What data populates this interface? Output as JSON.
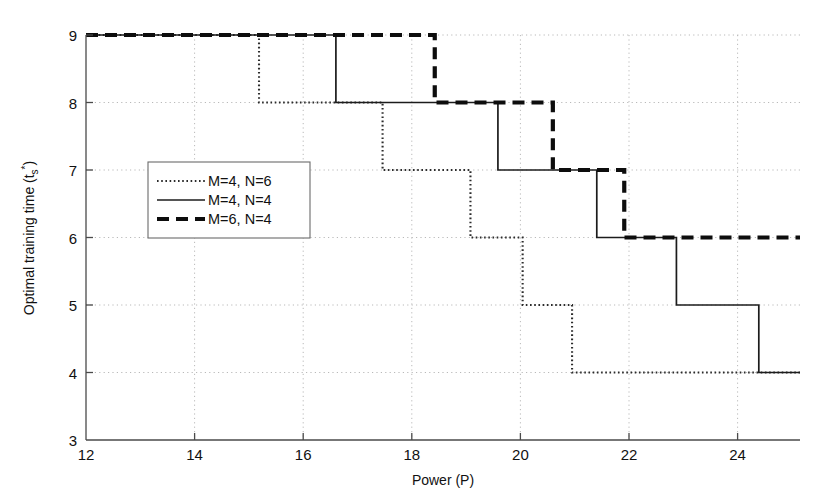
{
  "chart_data": {
    "type": "line",
    "title": "",
    "subtitle": "",
    "xlabel": "Power (P)",
    "ylabel": "Optimal training time (t",
    "ylabel_sub": "s",
    "ylabel_sup": "*",
    "ylabel_close": ")",
    "xlim": [
      12,
      25
    ],
    "ylim": [
      3,
      9
    ],
    "xticks": [
      12,
      14,
      16,
      18,
      20,
      22,
      24
    ],
    "xtick_labels": [
      "12",
      "14",
      "16",
      "18",
      "20",
      "22",
      "24"
    ],
    "yticks": [
      3,
      4,
      5,
      6,
      7,
      8,
      9
    ],
    "ytick_labels": [
      "3",
      "4",
      "5",
      "6",
      "7",
      "8",
      "9"
    ],
    "grid": true,
    "grid_style": "dotted",
    "legend_position": "center-left",
    "step_style": "post",
    "series": [
      {
        "name": "M=4, N=6",
        "style": "dotted",
        "color": "#2b2b2b",
        "x": [
          12.0,
          15.15,
          15.15,
          17.4,
          17.4,
          19.0,
          19.0,
          19.95,
          19.95,
          20.85,
          20.85,
          25.0
        ],
        "y": [
          9,
          9,
          8,
          8,
          7,
          7,
          6,
          6,
          5,
          5,
          4,
          4
        ],
        "breakpoints": [
          15.15,
          17.4,
          19.0,
          19.95,
          20.85
        ],
        "levels": [
          9,
          8,
          7,
          6,
          5,
          4
        ]
      },
      {
        "name": "M=4, N=4",
        "style": "solid",
        "color": "#1c1c1c",
        "x": [
          12.0,
          16.55,
          16.55,
          19.5,
          19.5,
          21.3,
          21.3,
          22.75,
          22.75,
          24.25,
          24.25,
          25.0
        ],
        "y": [
          9,
          9,
          8,
          8,
          7,
          7,
          6,
          6,
          5,
          5,
          4,
          4
        ],
        "breakpoints": [
          16.55,
          19.5,
          21.3,
          22.75,
          24.25
        ],
        "levels": [
          9,
          8,
          7,
          6,
          5,
          4
        ]
      },
      {
        "name": "M=6, N=4",
        "style": "dashed",
        "color": "#0d0d0d",
        "x": [
          12.0,
          18.35,
          18.35,
          20.5,
          20.5,
          21.8,
          21.8,
          25.0
        ],
        "y": [
          9,
          9,
          8,
          8,
          7,
          7,
          6,
          6
        ],
        "breakpoints": [
          18.35,
          20.5,
          21.8
        ],
        "levels": [
          9,
          8,
          7,
          6
        ]
      }
    ]
  },
  "legend": {
    "entries": [
      {
        "label": "M=4, N=6",
        "style": "dotted"
      },
      {
        "label": "M=4, N=4",
        "style": "solid"
      },
      {
        "label": "M=6, N=4",
        "style": "dashed"
      }
    ]
  }
}
